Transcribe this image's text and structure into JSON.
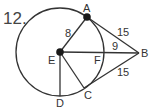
{
  "problem_number": "12.",
  "diagram": {
    "circle": {
      "center": "E",
      "cx": 60,
      "cy": 52,
      "r": 44
    },
    "points": {
      "A": {
        "label": "A",
        "x": 87,
        "y": 17
      },
      "B": {
        "label": "B",
        "x": 139,
        "y": 53
      },
      "C": {
        "label": "C",
        "x": 84,
        "y": 88
      },
      "D": {
        "label": "D",
        "x": 60,
        "y": 96
      },
      "E": {
        "label": "E",
        "x": 60,
        "y": 52
      },
      "F": {
        "label": "F",
        "x": 104,
        "y": 52
      }
    },
    "segments": [
      {
        "from": "E",
        "to": "A",
        "length_label": "8"
      },
      {
        "from": "A",
        "to": "B",
        "length_label": "15"
      },
      {
        "from": "C",
        "to": "B",
        "length_label": "15"
      },
      {
        "from": "E",
        "to": "B",
        "partial_label": "9",
        "partial_from": "F"
      },
      {
        "from": "E",
        "to": "C"
      },
      {
        "from": "E",
        "to": "D"
      }
    ],
    "labels": {
      "EA": "8",
      "AB": "15",
      "CB": "15",
      "FB": "9"
    },
    "colors": {
      "stroke": "#333333",
      "dot": "#1a1a1a"
    }
  }
}
